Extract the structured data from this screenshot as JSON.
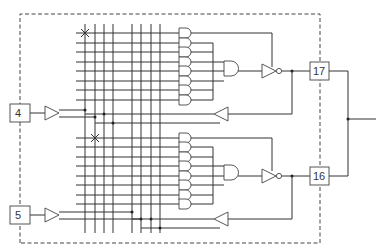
{
  "diagram": {
    "type": "PAL / programmable logic macrocell schematic",
    "colors": {
      "line": "#333333",
      "background": "#ffffff"
    },
    "pins": [
      {
        "id": "pin-4",
        "label": "4",
        "side": "left",
        "role": "input"
      },
      {
        "id": "pin-5",
        "label": "5",
        "side": "left",
        "role": "input"
      },
      {
        "id": "pin-17",
        "label": "17",
        "side": "right",
        "role": "output"
      },
      {
        "id": "pin-16",
        "label": "16",
        "side": "right",
        "role": "output"
      }
    ],
    "sections": [
      {
        "name": "upper-macrocell",
        "input_pin": "4",
        "output_pin": "17",
        "product_terms": 8,
        "fuse_mark": "X at top-left product line"
      },
      {
        "name": "lower-macrocell",
        "input_pin": "5",
        "output_pin": "16",
        "product_terms": 8,
        "fuse_mark": "X at top product line, second column"
      }
    ],
    "array_columns": 8,
    "note": "Dashed boundary encloses the device; outputs 17 and 16 joined outside the boundary"
  }
}
